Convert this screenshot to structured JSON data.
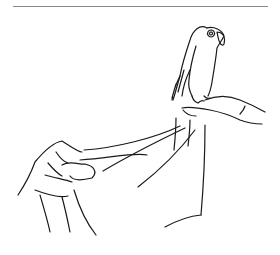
{
  "illustration": {
    "subject": "parrot perched on a hand, with a towel held by another hand",
    "style": "black line drawing on white",
    "colors": {
      "background": "#ffffff",
      "line": "#1a1a1a",
      "rule": "#8a8a8a"
    }
  }
}
